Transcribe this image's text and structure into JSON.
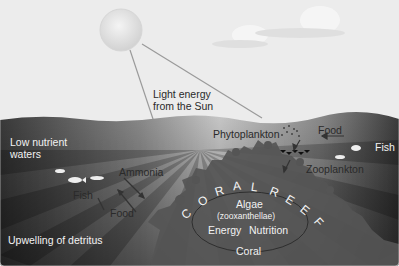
{
  "diagram": {
    "sky": {
      "sun_label_line1": "Light energy",
      "sun_label_line2": "from the Sun"
    },
    "labels": {
      "low_nutrient_line1": "Low nutrient",
      "low_nutrient_line2": "waters",
      "fish_left": "Fish",
      "ammonia": "Ammonia",
      "food_left": "Food",
      "upwelling": "Upwelling of detritus",
      "phytoplankton": "Phytoplankton",
      "food_right": "Food",
      "fish_right": "Fish",
      "zooplankton": "Zooplankton",
      "coral_reef": [
        "C",
        "O",
        "R",
        "A",
        "L",
        " ",
        "R",
        "E",
        "E",
        "F"
      ],
      "algae": "Algae",
      "zooxanthellae": "(zooxanthellae)",
      "energy": "Energy",
      "nutrition": "Nutrition",
      "coral": "Coral"
    },
    "colors": {
      "sky": "#ececec",
      "sun": "#e2e2e2",
      "water_dark": "#3a3a3a",
      "water_light": "#cfcfcf",
      "coral": "#5a5a5a",
      "text_dark": "#2a2a2a",
      "text_light": "#f2f2f2"
    }
  }
}
